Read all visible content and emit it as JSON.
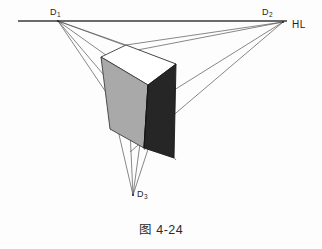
{
  "figure": {
    "caption": "图 4-24",
    "horizon_label": "HL",
    "vanishing_points": [
      {
        "id": "d1",
        "label": "D",
        "subscript": "1",
        "x": 58,
        "y": 21
      },
      {
        "id": "d2",
        "label": "D",
        "subscript": "2",
        "x": 283,
        "y": 22
      },
      {
        "id": "d3",
        "label": "D",
        "subscript": "3",
        "x": 133,
        "y": 195
      }
    ],
    "horizon_line": {
      "x1": 18,
      "y1": 21,
      "x2": 287,
      "y2": 21
    },
    "colors": {
      "line": "#4a4a4a",
      "horizon": "#3a3a3a",
      "face_left": "#a9a9a9",
      "face_right": "#262626",
      "face_top": "#ffffff",
      "text": "#1f1f1f",
      "background": "#fdfdfd"
    },
    "solid": {
      "name": "cube-three-point-perspective",
      "top_face": "101,57 126,45 176,64 148,85",
      "left_face": "101,57 148,85 144,148 110,129",
      "right_face": "148,85 176,64 174,158 144,148"
    },
    "construction_lines": [
      {
        "from": "d1",
        "to_x": 126,
        "to_y": 45
      },
      {
        "from": "d1",
        "to_x": 176,
        "to_y": 64
      },
      {
        "from": "d1",
        "to_x": 148,
        "to_y": 85
      },
      {
        "from": "d1",
        "to_x": 174,
        "to_y": 158
      },
      {
        "from": "d1",
        "to_x": 144,
        "to_y": 148
      },
      {
        "from": "d2",
        "to_x": 126,
        "to_y": 45
      },
      {
        "from": "d2",
        "to_x": 101,
        "to_y": 57
      },
      {
        "from": "d2",
        "to_x": 148,
        "to_y": 85
      },
      {
        "from": "d2",
        "to_x": 110,
        "to_y": 129
      },
      {
        "from": "d2",
        "to_x": 144,
        "to_y": 148
      },
      {
        "from": "d3",
        "to_x": 101,
        "to_y": 57
      },
      {
        "from": "d3",
        "to_x": 126,
        "to_y": 45
      },
      {
        "from": "d3",
        "to_x": 148,
        "to_y": 85
      },
      {
        "from": "d3",
        "to_x": 176,
        "to_y": 64
      }
    ]
  }
}
